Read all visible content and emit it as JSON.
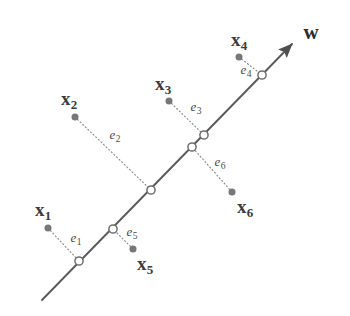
{
  "figure": {
    "background_color": "#ffffff",
    "axis_line_color": "#5a5a5a",
    "dot_color": "#777777",
    "marker_stroke_color": "#6e6e6e",
    "marker_fill_color": "#ffffff",
    "dotted_line_color": "#8a8a8a",
    "label_color": "#3a3a3a"
  },
  "direction_vector": {
    "label": "w",
    "label_x": 311,
    "label_y": 32,
    "line_start_x": 42,
    "line_start_y": 300,
    "line_end_x": 292,
    "line_end_y": 44,
    "arrow": "arrowhead"
  },
  "data_points": [
    {
      "id": "x1",
      "label": "x",
      "subscript": "1",
      "dot_x": 48,
      "dot_y": 228,
      "label_x": 43,
      "label_y": 211,
      "proj_x": 79,
      "proj_y": 261
    },
    {
      "id": "x2",
      "label": "x",
      "subscript": "2",
      "dot_x": 75,
      "dot_y": 117,
      "label_x": 69,
      "label_y": 100,
      "proj_x": 151,
      "proj_y": 190
    },
    {
      "id": "x3",
      "label": "x",
      "subscript": "3",
      "dot_x": 169,
      "dot_y": 101,
      "label_x": 163,
      "label_y": 85,
      "proj_x": 204,
      "proj_y": 135
    },
    {
      "id": "x4",
      "label": "x",
      "subscript": "4",
      "dot_x": 239,
      "dot_y": 57,
      "label_x": 239,
      "label_y": 41,
      "proj_x": 262,
      "proj_y": 75
    },
    {
      "id": "x5",
      "label": "x",
      "subscript": "5",
      "dot_x": 133,
      "dot_y": 249,
      "label_x": 145,
      "label_y": 265,
      "proj_x": 113,
      "proj_y": 229
    },
    {
      "id": "x6",
      "label": "x",
      "subscript": "6",
      "dot_x": 232,
      "dot_y": 192,
      "label_x": 245,
      "label_y": 208,
      "proj_x": 192,
      "proj_y": 147
    }
  ],
  "errors": [
    {
      "id": "e1",
      "label": "e",
      "subscript": "1",
      "label_x": 76,
      "label_y": 239
    },
    {
      "id": "e2",
      "label": "e",
      "subscript": "2",
      "label_x": 115,
      "label_y": 136
    },
    {
      "id": "e3",
      "label": "e",
      "subscript": "3",
      "label_x": 196,
      "label_y": 108
    },
    {
      "id": "e4",
      "label": "e",
      "subscript": "4",
      "label_x": 246,
      "label_y": 71
    },
    {
      "id": "e5",
      "label": "e",
      "subscript": "5",
      "label_x": 132,
      "label_y": 233
    },
    {
      "id": "e6",
      "label": "e",
      "subscript": "6",
      "label_x": 220,
      "label_y": 163
    }
  ]
}
